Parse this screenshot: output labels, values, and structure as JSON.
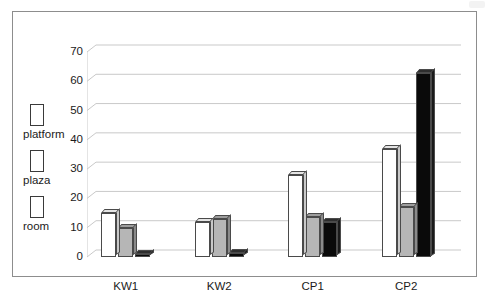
{
  "chart_data": {
    "type": "bar",
    "title": "",
    "subtitle": "",
    "xlabel": "",
    "ylabel": "",
    "categories": [
      "KW1",
      "KW2",
      "CP1",
      "CP2"
    ],
    "series": [
      {
        "name": "platform",
        "color": "#ffffff",
        "values": [
          15,
          12,
          28,
          37
        ]
      },
      {
        "name": "plaza",
        "color": "#b6b6b6",
        "values": [
          10,
          13,
          13.5,
          17
        ]
      },
      {
        "name": "room",
        "color": "#0a0a0a",
        "values": [
          1,
          1.5,
          12,
          63
        ]
      }
    ],
    "ylim": [
      0,
      70
    ],
    "ytick_values": [
      0,
      10,
      20,
      30,
      40,
      50,
      60,
      70
    ],
    "ytick_labels": [
      "0",
      "10",
      "20",
      "30",
      "40",
      "50",
      "60",
      "70"
    ],
    "grid": true,
    "grid_color": "#c9c9c9",
    "legend_position": "left-outside",
    "style": "3d-column",
    "border_color": "#8d8d8d"
  },
  "legend": {
    "entries": [
      {
        "label": "platform",
        "swatch": "#ffffff"
      },
      {
        "label": "plaza",
        "swatch": "#b6b6b6"
      },
      {
        "label": "room",
        "swatch": "#0a0a0a"
      }
    ]
  }
}
